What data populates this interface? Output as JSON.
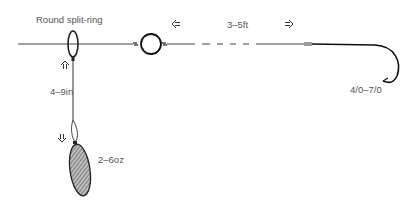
{
  "diagram": {
    "labels": {
      "split_ring": "Round split-ring",
      "trace_length": "3–5ft",
      "link_length": "4–9in",
      "sinker_weight": "2–6oz",
      "hook_size": "4/0–7/0"
    },
    "components": [
      "main-line",
      "round-split-ring",
      "swivel",
      "trace",
      "hook",
      "sinker-link",
      "sinker"
    ],
    "colors": {
      "line": "#333333",
      "text": "#555555",
      "sinker_fill": "#888888"
    }
  }
}
